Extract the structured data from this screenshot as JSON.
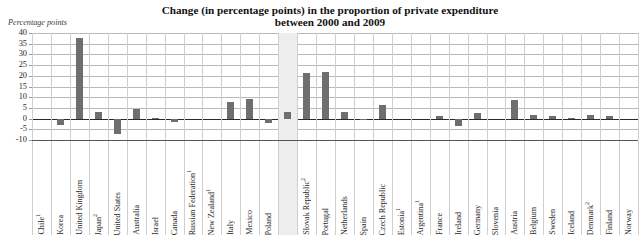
{
  "chart_data": {
    "type": "bar",
    "title": "Change (in percentage points) in the proportion of private expenditure between 2000 and 2009",
    "title_line1": "Change (in percentage points) in the proportion of private expenditure",
    "title_line2": "between 2000 and 2009",
    "ylabel": "Percentage points",
    "xlabel": "",
    "ylim": [
      -10,
      40
    ],
    "yticks": [
      40,
      35,
      30,
      25,
      20,
      15,
      10,
      5,
      0,
      -5,
      -10
    ],
    "ytick_labels": [
      "40",
      "35",
      "30",
      "25",
      "20",
      "15",
      "10",
      "5",
      "0",
      "-5",
      "-10"
    ],
    "grid": true,
    "legend": "none",
    "bar_color": "#6e6e6e",
    "highlight_color": "#ededed",
    "highlight_category": "OECD average",
    "categories": [
      "Chile¹",
      "Korea",
      "United Kingdom",
      "Japan²",
      "United States",
      "Australia",
      "Israel",
      "Canada",
      "Russian Federation¹",
      "New Zealand¹",
      "Italy",
      "Mexico",
      "Poland",
      "OECD average",
      "Slovak Republic²",
      "Portugal",
      "Netherlands",
      "Spain",
      "Czech Republic",
      "Estonia¹",
      "Argentina¹",
      "France",
      "Ireland",
      "Germany",
      "Slovenia",
      "Austria",
      "Belgium",
      "Sweden",
      "Iceland",
      "Denmark²",
      "Finland",
      "Norway"
    ],
    "values": [
      0,
      -3.0,
      37.5,
      3.2,
      -7.0,
      4.5,
      0.3,
      -1.5,
      0,
      0,
      7.8,
      9.0,
      -2.0,
      3.3,
      21.5,
      21.8,
      3.2,
      -0.2,
      6.5,
      0,
      0,
      1.2,
      -3.5,
      2.6,
      0,
      8.6,
      1.5,
      1.2,
      0.2,
      1.8,
      1.3,
      0
    ],
    "bold_categories": [
      "OECD average"
    ]
  },
  "footnote_markers": {
    "one": "1",
    "two": "2"
  }
}
